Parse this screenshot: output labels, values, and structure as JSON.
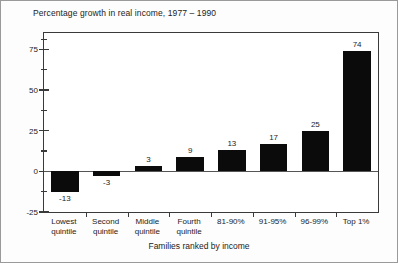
{
  "chart_data": {
    "type": "bar",
    "title": "Percentage growth in real income, 1977 – 1990",
    "xlabel": "Families ranked by income",
    "ylabel": "",
    "categories": [
      "Lowest\nquintile",
      "Second\nquintile",
      "Middle\nquintile",
      "Fourth\nquintile",
      "81-90%",
      "91-95%",
      "96-99%",
      "Top 1%"
    ],
    "values": [
      -13,
      -3,
      3,
      9,
      13,
      17,
      25,
      74
    ],
    "value_labels": [
      "-13",
      "-3",
      "3",
      "9",
      "13",
      "17",
      "25",
      "74"
    ],
    "ylim": [
      -25,
      85
    ],
    "ytick_labels": [
      "75",
      "50",
      "25",
      "0",
      "-25"
    ],
    "ytick_values": [
      75,
      50,
      25,
      0,
      -25
    ],
    "yminor_values": [
      81.25,
      62.5,
      37.5,
      12.5,
      -12.5
    ],
    "grid": false,
    "legend": false,
    "bar_color": "#0b0b0b",
    "axis_color": "#3a3a3a",
    "background": "#ffffff"
  },
  "figure": {
    "title": "Percentage growth in real income, 1977 – 1990",
    "xaxis_title": "Families ranked by income"
  }
}
